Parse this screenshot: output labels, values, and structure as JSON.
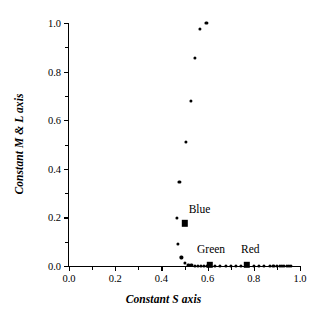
{
  "chart_data": {
    "type": "scatter",
    "title": "",
    "xlabel": "Constant S axis",
    "ylabel": "Constant M & L axis",
    "xlim": [
      0.0,
      1.0
    ],
    "ylim": [
      0.0,
      1.0
    ],
    "grid": false,
    "legend_position": "inline-annotations",
    "xticks": [
      "0.0",
      "0.2",
      "0.4",
      "0.6",
      "0.8",
      "1.0"
    ],
    "xtick_values": [
      0.0,
      0.2,
      0.4,
      0.6,
      0.8,
      1.0
    ],
    "yticks": [
      "0.0",
      "0.2",
      "0.4",
      "0.6",
      "0.8",
      "1.0"
    ],
    "ytick_values": [
      0.0,
      0.2,
      0.4,
      0.6,
      0.8,
      1.0
    ],
    "minor_xtick_values": [
      0.1,
      0.3,
      0.5,
      0.7,
      0.9
    ],
    "minor_ytick_values": [
      0.1,
      0.3,
      0.5,
      0.7,
      0.9
    ],
    "series": [
      {
        "name": "data-points",
        "marker": "circle",
        "color": "#000000",
        "points": [
          [
            0.595,
            1.0
          ],
          [
            0.566,
            0.975
          ],
          [
            0.545,
            0.855
          ],
          [
            0.527,
            0.68
          ],
          [
            0.505,
            0.51
          ],
          [
            0.478,
            0.345
          ],
          [
            0.468,
            0.198
          ],
          [
            0.47,
            0.092
          ],
          [
            0.487,
            0.035
          ],
          [
            0.5,
            0.012
          ],
          [
            0.517,
            0.005
          ],
          [
            0.53,
            0.003
          ],
          [
            0.545,
            0.002
          ],
          [
            0.557,
            0.002
          ],
          [
            0.57,
            0.001
          ],
          [
            0.583,
            0.001
          ],
          [
            0.596,
            0.001
          ],
          [
            0.63,
            0.001
          ],
          [
            0.655,
            0.001
          ],
          [
            0.68,
            0.001
          ],
          [
            0.7,
            0.001
          ],
          [
            0.722,
            0.001
          ],
          [
            0.745,
            0.001
          ],
          [
            0.8,
            0.001
          ],
          [
            0.822,
            0.001
          ],
          [
            0.845,
            0.001
          ],
          [
            0.868,
            0.001
          ],
          [
            0.885,
            0.001
          ],
          [
            0.9,
            0.001
          ],
          [
            0.912,
            0.001
          ],
          [
            0.922,
            0.001
          ],
          [
            0.932,
            0.001
          ],
          [
            0.942,
            0.001
          ],
          [
            0.952,
            0.001
          ],
          [
            0.962,
            0.001
          ]
        ]
      }
    ],
    "annotations": [
      {
        "label": "Blue",
        "x": 0.5,
        "y": 0.175,
        "label_x": 0.565,
        "label_y": 0.235,
        "marker": "square"
      },
      {
        "label": "Green",
        "x": 0.61,
        "y": 0.005,
        "label_x": 0.615,
        "label_y": 0.07,
        "marker": "square"
      },
      {
        "label": "Red",
        "x": 0.77,
        "y": 0.005,
        "label_x": 0.785,
        "label_y": 0.07,
        "marker": "square"
      }
    ]
  }
}
